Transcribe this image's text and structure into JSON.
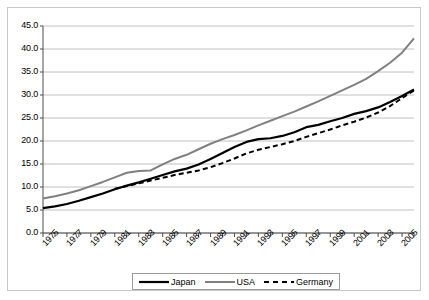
{
  "chart_data": {
    "type": "line",
    "title": "",
    "subtitle": "",
    "xlabel": "",
    "ylabel": "",
    "grid": true,
    "legend_position": "bottom",
    "xlim": [
      1975,
      2006
    ],
    "ylim": [
      0.0,
      45.0
    ],
    "ytick_step": 5.0,
    "x": [
      1975,
      1976,
      1977,
      1978,
      1979,
      1980,
      1981,
      1982,
      1983,
      1984,
      1985,
      1986,
      1987,
      1988,
      1989,
      1990,
      1991,
      1992,
      1993,
      1994,
      1995,
      1996,
      1997,
      1998,
      1999,
      2000,
      2001,
      2002,
      2003,
      2004,
      2005,
      2006
    ],
    "xticklabels": [
      "1975",
      "1977",
      "1979",
      "1981",
      "1983",
      "1985",
      "1987",
      "1989",
      "1991",
      "1993",
      "1995",
      "1997",
      "1999",
      "2001",
      "2003",
      "2005"
    ],
    "yticklabels": [
      "0.0",
      "5.0",
      "10.0",
      "15.0",
      "20.0",
      "25.0",
      "30.0",
      "35.0",
      "40.0",
      "45.0"
    ],
    "series": [
      {
        "name": "Japan",
        "color": "#000000",
        "style": "solid",
        "width": 2.2,
        "values": [
          5.4,
          5.8,
          6.3,
          7.0,
          7.8,
          8.6,
          9.5,
          10.3,
          11.0,
          11.8,
          12.6,
          13.4,
          14.0,
          14.9,
          16.1,
          17.4,
          18.7,
          19.8,
          20.4,
          20.6,
          21.1,
          21.9,
          23.0,
          23.5,
          24.3,
          25.0,
          25.9,
          26.5,
          27.3,
          28.5,
          29.8,
          31.2
        ]
      },
      {
        "name": "USA",
        "color": "#808080",
        "style": "solid",
        "width": 2.0,
        "values": [
          7.5,
          8.0,
          8.6,
          9.3,
          10.2,
          11.1,
          12.1,
          13.1,
          13.5,
          13.6,
          14.9,
          16.1,
          17.0,
          18.2,
          19.4,
          20.4,
          21.3,
          22.3,
          23.4,
          24.4,
          25.4,
          26.4,
          27.5,
          28.6,
          29.8,
          31.0,
          32.2,
          33.5,
          35.2,
          37.0,
          39.2,
          42.3
        ]
      },
      {
        "name": "Germany",
        "color": "#000000",
        "style": "dashed",
        "width": 2.0,
        "values": [
          null,
          null,
          null,
          null,
          null,
          null,
          9.6,
          10.2,
          10.8,
          11.4,
          12.0,
          12.6,
          13.1,
          13.6,
          14.3,
          15.2,
          16.2,
          17.3,
          18.1,
          18.7,
          19.3,
          20.0,
          20.9,
          21.7,
          22.5,
          23.4,
          24.2,
          25.1,
          26.2,
          27.6,
          29.3,
          31.0
        ]
      }
    ]
  },
  "legend": {
    "items": [
      {
        "label": "Japan"
      },
      {
        "label": "USA"
      },
      {
        "label": "Germany"
      }
    ]
  }
}
